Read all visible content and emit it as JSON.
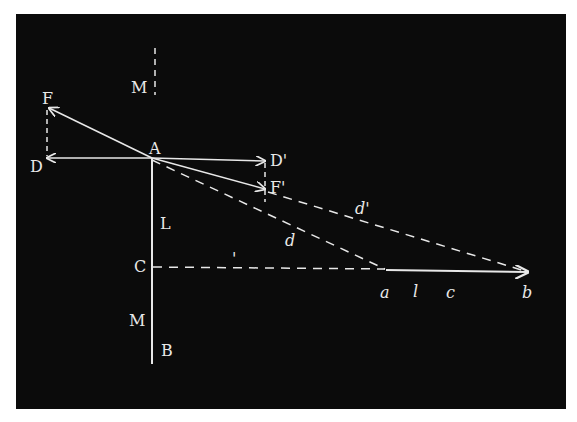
{
  "figure": {
    "background": "#0b0b0b",
    "line_color": "#e8e8e8",
    "labels": {
      "M_top": "M",
      "F": "F",
      "A": "A",
      "D": "D",
      "D_prime": "D'",
      "F_prime": "F'",
      "L": "L",
      "C": "C",
      "M_bottom": "M",
      "B": "B",
      "d": "d",
      "d_prime": "d'",
      "tick_mark": "'",
      "a": "a",
      "l": "l",
      "c": "c",
      "b": "b"
    }
  }
}
